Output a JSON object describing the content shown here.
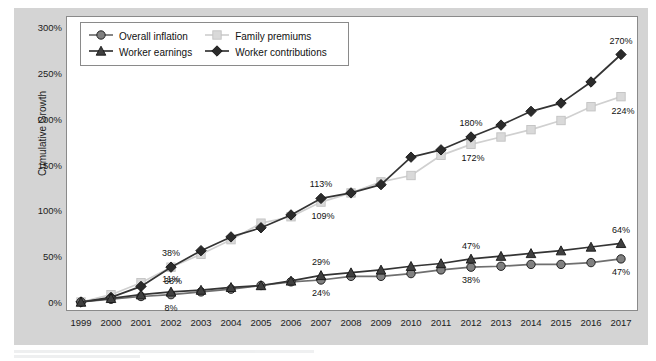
{
  "legend": {
    "position": "top-left-inside",
    "items": [
      {
        "label": "Overall inflation",
        "marker": "circle",
        "color": "#808080"
      },
      {
        "label": "Family premiums",
        "marker": "square",
        "color": "#d9d9d9"
      },
      {
        "label": "Worker earnings",
        "marker": "triangle",
        "color": "#3f3f3f"
      },
      {
        "label": "Worker contributions",
        "marker": "diamond",
        "color": "#2b2b2b"
      }
    ]
  },
  "axes": {
    "ylabel": "Cumulative Growth",
    "yticks": [
      "0%",
      "50%",
      "100%",
      "150%",
      "200%",
      "250%",
      "300%"
    ],
    "xticks": [
      "1999",
      "2000",
      "2001",
      "2002",
      "2003",
      "2004",
      "2005",
      "2006",
      "2007",
      "2008",
      "2009",
      "2010",
      "2011",
      "2012",
      "2013",
      "2014",
      "2015",
      "2016",
      "2017"
    ]
  },
  "chart_data": {
    "type": "line",
    "title": "",
    "xlabel": "",
    "ylabel": "Cumulative Growth",
    "ylim": [
      0,
      300
    ],
    "grid": false,
    "legend_position": "upper left",
    "x": [
      1999,
      2000,
      2001,
      2002,
      2003,
      2004,
      2005,
      2006,
      2007,
      2008,
      2009,
      2010,
      2011,
      2012,
      2013,
      2014,
      2015,
      2016,
      2017
    ],
    "series": [
      {
        "name": "Worker contributions",
        "marker": "diamond",
        "color": "#2b2b2b",
        "values": [
          0,
          5,
          17,
          38,
          56,
          71,
          81,
          95,
          113,
          119,
          128,
          158,
          166,
          180,
          193,
          208,
          217,
          240,
          270
        ],
        "labels": [
          {
            "x": 2002,
            "value": 38,
            "text": "38%"
          },
          {
            "x": 2007,
            "value": 113,
            "text": "113%"
          },
          {
            "x": 2012,
            "value": 180,
            "text": "180%"
          },
          {
            "x": 2017,
            "value": 270,
            "text": "270%"
          }
        ]
      },
      {
        "name": "Family premiums",
        "marker": "square",
        "color": "#d9d9d9",
        "values": [
          0,
          8,
          21,
          38,
          52,
          68,
          86,
          93,
          109,
          119,
          131,
          138,
          160,
          172,
          180,
          188,
          198,
          213,
          224
        ],
        "labels": [
          {
            "x": 2002,
            "value": 38,
            "text": "38%"
          },
          {
            "x": 2007,
            "value": 109,
            "text": "109%"
          },
          {
            "x": 2012,
            "value": 172,
            "text": "172%"
          },
          {
            "x": 2017,
            "value": 224,
            "text": "224%"
          }
        ]
      },
      {
        "name": "Worker earnings",
        "marker": "triangle",
        "color": "#3f3f3f",
        "values": [
          0,
          4,
          8,
          11,
          13,
          16,
          18,
          23,
          29,
          32,
          35,
          39,
          42,
          47,
          50,
          53,
          56,
          60,
          64
        ],
        "labels": [
          {
            "x": 2002,
            "value": 11,
            "text": "11%"
          },
          {
            "x": 2007,
            "value": 29,
            "text": "29%"
          },
          {
            "x": 2012,
            "value": 47,
            "text": "47%"
          },
          {
            "x": 2017,
            "value": 64,
            "text": "64%"
          }
        ]
      },
      {
        "name": "Overall inflation",
        "marker": "circle",
        "color": "#808080",
        "values": [
          0,
          3,
          6,
          8,
          11,
          14,
          18,
          22,
          24,
          28,
          28,
          31,
          35,
          38,
          39,
          41,
          41,
          43,
          47
        ],
        "labels": [
          {
            "x": 2002,
            "value": 8,
            "text": "8%"
          },
          {
            "x": 2007,
            "value": 24,
            "text": "24%"
          },
          {
            "x": 2012,
            "value": 38,
            "text": "38%"
          },
          {
            "x": 2017,
            "value": 47,
            "text": "47%"
          }
        ]
      }
    ],
    "label_offsets": {
      "Worker contributions": {
        "dx": 0,
        "dy": -14
      },
      "Family premiums": {
        "dx": 2,
        "dy": 14
      },
      "Worker earnings": {
        "dx": 0,
        "dy": -13
      },
      "Overall inflation": {
        "dx": 0,
        "dy": 13
      }
    }
  }
}
